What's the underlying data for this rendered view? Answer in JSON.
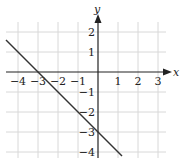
{
  "chart_data": {
    "type": "line",
    "title": "",
    "xlabel": "x",
    "ylabel": "y",
    "xlim": [
      -4.3,
      3.3
    ],
    "ylim": [
      -4.3,
      2.5
    ],
    "grid": true,
    "x_ticks": [
      -4,
      -3,
      -2,
      -1,
      1,
      2,
      3
    ],
    "y_ticks": [
      2,
      1,
      -1,
      -2,
      -3,
      -4
    ],
    "x_tick_labels": [
      "−4",
      "−3",
      "−2",
      "−1",
      "1",
      "2",
      "3"
    ],
    "y_tick_labels": [
      "2",
      "1",
      "−1",
      "−2",
      "−3",
      "−4"
    ],
    "series": [
      {
        "name": "line",
        "equation": "y = -x - 3",
        "x": [
          -4.6,
          1.2
        ],
        "y": [
          1.6,
          -4.2
        ],
        "points_on_line": [
          [
            -3,
            0
          ],
          [
            0,
            -3
          ]
        ],
        "color": "#333333"
      }
    ]
  },
  "colors": {
    "grid": "#d8d8d8",
    "axis": "#222222",
    "line": "#333333"
  }
}
